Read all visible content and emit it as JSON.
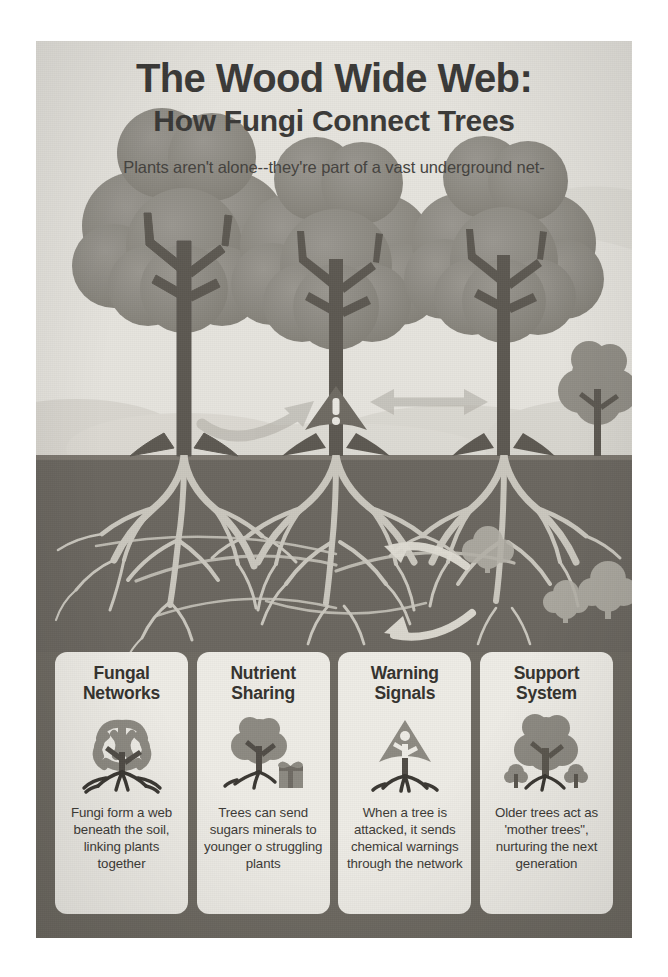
{
  "poster": {
    "title": "The Wood Wide Web:",
    "subtitle": "How Fungi Connect Trees",
    "tagline": "Plants aren't alone--they're part of a vast underground net-",
    "background_color": "#eceae4",
    "soil_color": "#6b6760",
    "sky_color": "#e4e2dc",
    "tree_color": "#8b8880",
    "trunk_color": "#605c55",
    "root_color": "#d5d2c9",
    "card_strip_color": "#6e6a62",
    "card_color": "#eeece6",
    "text_color": "#3b3a38"
  },
  "scene": {
    "trees": [
      {
        "name": "left-tree",
        "label": "mature tree"
      },
      {
        "name": "center-tree",
        "label": "attacked tree"
      },
      {
        "name": "right-tree",
        "label": "mature tree"
      },
      {
        "name": "right-sapling",
        "label": "sapling"
      }
    ],
    "arrows": [
      {
        "name": "nutrient-transfer-arrow",
        "direction": "left-to-center",
        "style": "curved"
      },
      {
        "name": "signal-exchange-arrow",
        "direction": "bidirectional",
        "style": "double-headed"
      },
      {
        "name": "root-signal-arrow-left",
        "direction": "right-to-left",
        "style": "curved-underground"
      },
      {
        "name": "root-signal-arrow-down",
        "direction": "left-to-right",
        "style": "curved-underground"
      }
    ],
    "warning_marker": "!",
    "underground_shrubs": 3
  },
  "cards": [
    {
      "title_line1": "Fungal",
      "title_line2": "Networks",
      "icon": "network-tree-icon",
      "body": "Fungi form a web beneath the soil, linking plants together"
    },
    {
      "title_line1": "Nutrient",
      "title_line2": "Sharing",
      "icon": "tree-gift-icon",
      "body": "Trees can send sugars minerals to younger o struggling plants"
    },
    {
      "title_line1": "Warning",
      "title_line2": "Signals",
      "icon": "warning-tree-icon",
      "body": "When a tree is attacked, it sends chemical warnings through the network"
    },
    {
      "title_line1": "Support",
      "title_line2": "System",
      "icon": "mother-tree-icon",
      "body": "Older trees act as 'mother trees\", nurturing the next generation"
    }
  ]
}
